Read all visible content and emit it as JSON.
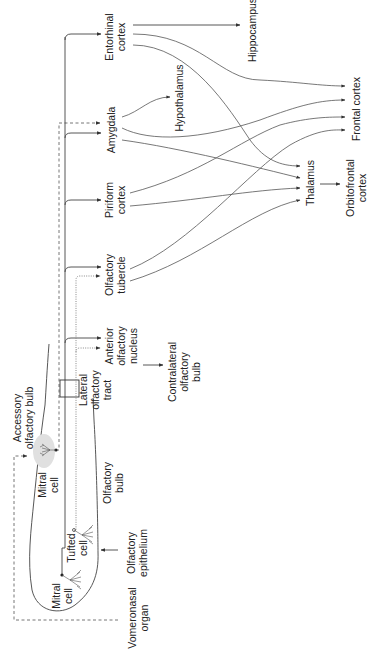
{
  "diagram": {
    "orientation": "rotated 90 degrees counter-clockwise",
    "colors": {
      "line": "#444444",
      "text": "#222222",
      "accessory_bulb_shading": "#e0e0e0",
      "background": "#ffffff"
    },
    "labels": {
      "entorhinal": [
        "Entorhinal",
        "cortex"
      ],
      "hippocampus": [
        "Hippocampus"
      ],
      "amygdala": [
        "Amygdala"
      ],
      "hypothalamus": [
        "Hypothalamus"
      ],
      "frontal": [
        "Frontal cortex"
      ],
      "piriform": [
        "Piriform",
        "cortex"
      ],
      "thalamus": [
        "Thalamus"
      ],
      "orbitofrontal": [
        "Orbitofrontal",
        "cortex"
      ],
      "tubercle": [
        "Olfactory",
        "tubercle"
      ],
      "aon": [
        "Anterior",
        "olfactory",
        "nucleus"
      ],
      "contralateral": [
        "Contralateral",
        "olfactory",
        "bulb"
      ],
      "lot": [
        "Lateral",
        "olfactory",
        "tract"
      ],
      "accessory": [
        "Accessory",
        "olfactory bulb"
      ],
      "mitral_top": [
        "Mitral",
        "cell"
      ],
      "olfactory_bulb": [
        "Olfactory",
        "bulb"
      ],
      "tufted": [
        "Tufted",
        "cell"
      ],
      "mitral_bottom": [
        "Mitral",
        "cell"
      ],
      "epithelium": [
        "Olfactory",
        "epithelium"
      ],
      "vomeronasal": [
        "Vomeronasal",
        "organ"
      ]
    },
    "connections": [
      {
        "from": "Olfactory epithelium",
        "to": "Olfactory bulb",
        "style": "solid"
      },
      {
        "from": "Vomeronasal organ",
        "to": "Accessory olfactory bulb",
        "style": "dashed"
      },
      {
        "from": "Accessory olfactory bulb",
        "to": "Amygdala",
        "style": "dashed"
      },
      {
        "from": "Mitral cell",
        "to": "Anterior olfactory nucleus",
        "style": "solid"
      },
      {
        "from": "Mitral cell",
        "to": "Olfactory tubercle",
        "style": "solid"
      },
      {
        "from": "Mitral cell",
        "to": "Piriform cortex",
        "style": "solid"
      },
      {
        "from": "Mitral cell",
        "to": "Amygdala",
        "style": "solid"
      },
      {
        "from": "Mitral cell",
        "to": "Entorhinal cortex",
        "style": "solid"
      },
      {
        "from": "Tufted cell",
        "to": "Anterior olfactory nucleus",
        "style": "dotted"
      },
      {
        "from": "Tufted cell",
        "to": "Olfactory tubercle",
        "style": "dotted"
      },
      {
        "from": "Anterior olfactory nucleus",
        "to": "Contralateral olfactory bulb",
        "style": "solid"
      },
      {
        "from": "Entorhinal cortex",
        "to": "Hippocampus",
        "style": "solid"
      },
      {
        "from": "Entorhinal cortex",
        "to": "Frontal cortex",
        "style": "solid"
      },
      {
        "from": "Entorhinal cortex",
        "to": "Thalamus",
        "style": "solid"
      },
      {
        "from": "Amygdala",
        "to": "Hypothalamus",
        "style": "solid"
      },
      {
        "from": "Amygdala",
        "to": "Frontal cortex",
        "style": "solid"
      },
      {
        "from": "Amygdala",
        "to": "Thalamus",
        "style": "solid"
      },
      {
        "from": "Piriform cortex",
        "to": "Frontal cortex",
        "style": "solid"
      },
      {
        "from": "Piriform cortex",
        "to": "Thalamus",
        "style": "solid"
      },
      {
        "from": "Olfactory tubercle",
        "to": "Frontal cortex",
        "style": "solid"
      },
      {
        "from": "Olfactory tubercle",
        "to": "Thalamus",
        "style": "solid"
      },
      {
        "from": "Thalamus",
        "to": "Orbitofrontal cortex",
        "style": "solid"
      }
    ]
  }
}
